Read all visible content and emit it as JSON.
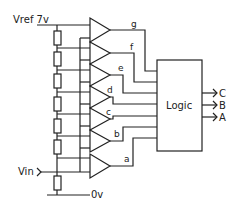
{
  "diagram": {
    "type": "flash ADC circuit",
    "labels": {
      "vref": "Vref 7v",
      "vin": "Vin",
      "ground": "0v",
      "logic": "Logic"
    },
    "comparator_outputs": [
      "g",
      "f",
      "e",
      "d",
      "c",
      "b",
      "a"
    ],
    "logic_outputs": [
      "C",
      "B",
      "A"
    ],
    "resistor_count": 8,
    "comparator_count": 7
  }
}
